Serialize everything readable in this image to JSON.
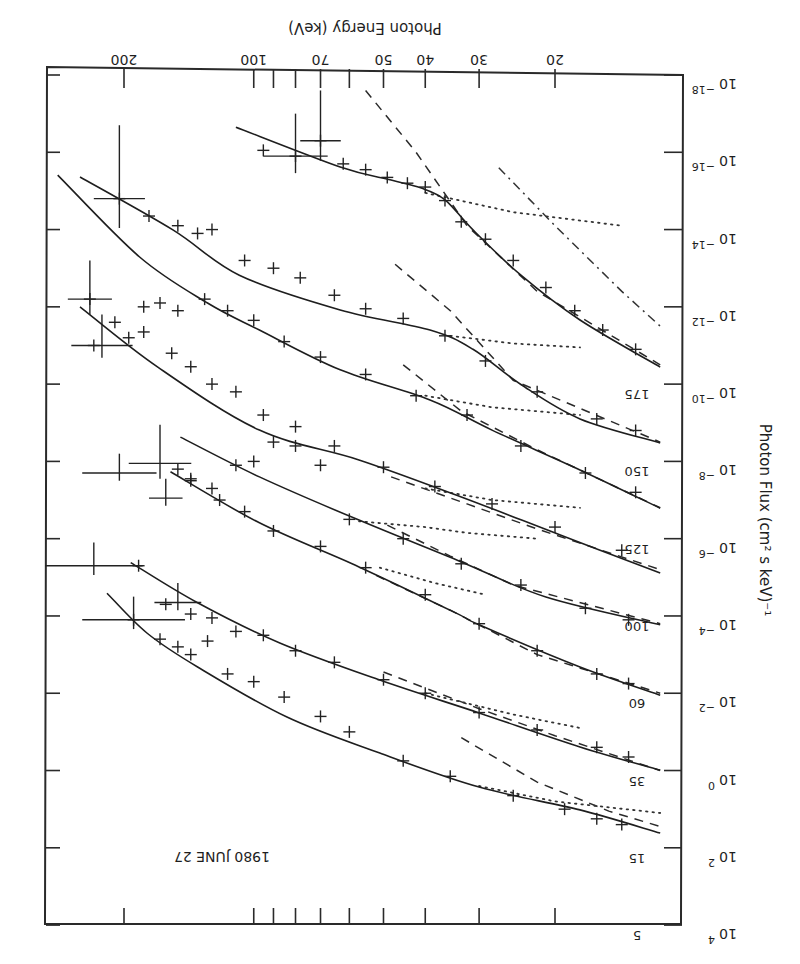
{
  "chart_data": {
    "type": "line",
    "title": "1980 JUNE 27",
    "xlabel": "Photon Energy (keV)",
    "ylabel": "Photon Flux (cm² s keV)⁻¹",
    "xscale": "log",
    "yscale": "log",
    "orientation_note": "figure displayed rotated 180 degrees",
    "xlim": [
      11,
      300
    ],
    "ylim_exponent": [
      -18,
      4
    ],
    "x_ticks": [
      {
        "value": 20,
        "label": "20"
      },
      {
        "value": 30,
        "label": "30"
      },
      {
        "value": 40,
        "label": "40"
      },
      {
        "value": 50,
        "label": "50"
      },
      {
        "value": 60,
        "label": ""
      },
      {
        "value": 70,
        "label": "70"
      },
      {
        "value": 80,
        "label": ""
      },
      {
        "value": 90,
        "label": ""
      },
      {
        "value": 100,
        "label": "100"
      },
      {
        "value": 200,
        "label": "200"
      }
    ],
    "y_ticks": [
      {
        "exp": -18,
        "base": "10",
        "sup": "−18"
      },
      {
        "exp": -16,
        "base": "10",
        "sup": "−16"
      },
      {
        "exp": -14,
        "base": "10",
        "sup": "−14"
      },
      {
        "exp": -12,
        "base": "10",
        "sup": "−12"
      },
      {
        "exp": -10,
        "base": "10",
        "sup": "−10"
      },
      {
        "exp": -8,
        "base": "10",
        "sup": "−8"
      },
      {
        "exp": -6,
        "base": "10",
        "sup": "−6"
      },
      {
        "exp": -4,
        "base": "10",
        "sup": "−4"
      },
      {
        "exp": -2,
        "base": "10",
        "sup": "−2"
      },
      {
        "exp": 0,
        "base": "10",
        "sup": "0"
      },
      {
        "exp": 2,
        "base": "10",
        "sup": "2"
      },
      {
        "exp": 4,
        "base": "10",
        "sup": "4"
      }
    ],
    "series": [
      {
        "name": "5",
        "label_exp": 4.0,
        "fit": [
          [
            219,
            -4.59
          ],
          [
            177,
            -3.56
          ],
          [
            135,
            -2.68
          ],
          [
            84,
            -1.39
          ],
          [
            51,
            -0.45
          ],
          [
            30,
            0.43
          ],
          [
            17.5,
            1.02
          ],
          [
            11.4,
            1.62
          ]
        ],
        "dotted": [
          [
            30,
            0.4
          ],
          [
            20,
            0.8
          ],
          [
            11.4,
            1.1
          ]
        ],
        "dashed": [
          [
            33,
            -0.85
          ],
          [
            22,
            0.3
          ],
          [
            15,
            1.05
          ],
          [
            11.4,
            1.45
          ]
        ],
        "points": [
          [
            190,
            -3.9
          ],
          [
            165,
            -3.4
          ],
          [
            150,
            -3.2
          ],
          [
            140,
            -3.0
          ],
          [
            128,
            -3.35
          ],
          [
            115,
            -2.5
          ],
          [
            100,
            -2.3
          ],
          [
            85,
            -1.9
          ],
          [
            70,
            -1.4
          ],
          [
            60,
            -1.0
          ],
          [
            45,
            -0.25
          ],
          [
            35,
            0.15
          ],
          [
            25,
            0.65
          ],
          [
            19,
            1.0
          ],
          [
            16,
            1.25
          ],
          [
            14,
            1.4
          ]
        ],
        "bigerr": [
          [
            190,
            -3.9,
            60,
            0.6
          ]
        ]
      },
      {
        "name": "15",
        "label_exp": 2.0,
        "fit": [
          [
            193,
            -5.38
          ],
          [
            135,
            -4.34
          ],
          [
            87,
            -3.3
          ],
          [
            51,
            -2.34
          ],
          [
            30,
            -1.49
          ],
          [
            17.5,
            -0.61
          ],
          [
            11.4,
            -0.01
          ]
        ],
        "dotted": [
          [
            40,
            -2.0
          ],
          [
            25,
            -1.45
          ],
          [
            17.5,
            -1.1
          ]
        ],
        "dashed": [
          [
            50,
            -2.55
          ],
          [
            30,
            -1.6
          ],
          [
            20,
            -0.9
          ],
          [
            11.4,
            0.0
          ]
        ],
        "points": [
          [
            185,
            -5.3
          ],
          [
            160,
            -4.3
          ],
          [
            140,
            -4.05
          ],
          [
            125,
            -3.95
          ],
          [
            110,
            -3.6
          ],
          [
            95,
            -3.5
          ],
          [
            80,
            -3.1
          ],
          [
            65,
            -2.8
          ],
          [
            50,
            -2.35
          ],
          [
            40,
            -2.0
          ],
          [
            30,
            -1.5
          ],
          [
            22,
            -1.05
          ],
          [
            16,
            -0.6
          ],
          [
            13.5,
            -0.35
          ]
        ],
        "bigerr": [
          [
            235,
            -5.3,
            70,
            0.6
          ],
          [
            150,
            -4.35,
            20,
            0.5
          ]
        ]
      },
      {
        "name": "35",
        "label_exp": 0.0,
        "fit": [
          [
            156,
            -7.73
          ],
          [
            97,
            -6.41
          ],
          [
            57,
            -5.27
          ],
          [
            34,
            -4.08
          ],
          [
            30,
            -3.77
          ],
          [
            17.5,
            -2.68
          ],
          [
            11.4,
            -1.95
          ]
        ],
        "dotted": [
          [
            51,
            -5.25
          ],
          [
            38,
            -4.85
          ],
          [
            29,
            -4.55
          ]
        ],
        "dashed": [
          [
            52,
            -5.05
          ],
          [
            35,
            -4.15
          ],
          [
            22,
            -3.0
          ],
          [
            11.4,
            -2.0
          ]
        ],
        "points": [
          [
            140,
            -7.55
          ],
          [
            120,
            -7.0
          ],
          [
            105,
            -6.7
          ],
          [
            90,
            -6.2
          ],
          [
            70,
            -5.8
          ],
          [
            55,
            -5.25
          ],
          [
            40,
            -4.55
          ],
          [
            30,
            -3.8
          ],
          [
            22,
            -3.1
          ],
          [
            16,
            -2.5
          ],
          [
            13.5,
            -2.25
          ]
        ],
        "bigerr": [
          [
            205,
            -7.7,
            45,
            0.5
          ],
          [
            160,
            -7.05,
            15,
            0.5
          ]
        ]
      },
      {
        "name": "60",
        "label_exp": -2.0,
        "fit": [
          [
            148,
            -8.63
          ],
          [
            97,
            -7.6
          ],
          [
            57,
            -6.48
          ],
          [
            33,
            -5.4
          ],
          [
            21,
            -4.49
          ],
          [
            11.4,
            -3.77
          ]
        ],
        "dotted": [
          [
            57,
            -6.45
          ],
          [
            40,
            -6.3
          ],
          [
            32,
            -6.15
          ],
          [
            22,
            -6.0
          ]
        ],
        "dashed": [
          [
            49,
            -6.35
          ],
          [
            35,
            -5.55
          ],
          [
            25,
            -4.8
          ],
          [
            11.4,
            -3.8
          ]
        ],
        "points": [
          [
            150,
            -7.8
          ],
          [
            140,
            -7.5
          ],
          [
            125,
            -7.3
          ],
          [
            110,
            -7.9
          ],
          [
            100,
            -8.0
          ],
          [
            90,
            -8.5
          ],
          [
            80,
            -8.4
          ],
          [
            70,
            -7.9
          ],
          [
            60,
            -6.5
          ],
          [
            45,
            -6.0
          ],
          [
            33,
            -5.35
          ],
          [
            24,
            -4.8
          ],
          [
            17,
            -4.2
          ],
          [
            13.5,
            -3.9
          ]
        ],
        "bigerr": [
          [
            165,
            -7.95,
            30,
            1.0
          ]
        ]
      },
      {
        "name": "100",
        "label_exp": -4.0,
        "fit": [
          [
            253,
            -12.0
          ],
          [
            167,
            -10.44
          ],
          [
            97,
            -8.81
          ],
          [
            57,
            -8.04
          ],
          [
            33,
            -7.08
          ],
          [
            19.5,
            -6.1
          ],
          [
            11.4,
            -5.11
          ]
        ],
        "dotted": [
          [
            40,
            -7.3
          ],
          [
            28,
            -7.0
          ],
          [
            17.5,
            -6.8
          ]
        ],
        "dashed": [
          [
            48,
            -7.6
          ],
          [
            32,
            -6.9
          ],
          [
            22,
            -6.25
          ],
          [
            11.4,
            -5.2
          ]
        ],
        "points": [
          [
            235,
            -11.0
          ],
          [
            195,
            -11.2
          ],
          [
            180,
            -11.35
          ],
          [
            155,
            -10.8
          ],
          [
            140,
            -10.45
          ],
          [
            125,
            -10.0
          ],
          [
            110,
            -9.8
          ],
          [
            95,
            -9.2
          ],
          [
            80,
            -8.9
          ],
          [
            65,
            -8.4
          ],
          [
            50,
            -7.85
          ],
          [
            38,
            -7.35
          ],
          [
            28,
            -6.9
          ],
          [
            20,
            -6.3
          ],
          [
            14,
            -5.7
          ]
        ],
        "bigerr": [
          [
            225,
            -11.0,
            40,
            0.8
          ]
        ]
      },
      {
        "name": "125",
        "label_exp": -6.0,
        "fit": [
          [
            285,
            -15.41
          ],
          [
            184,
            -13.29
          ],
          [
            128,
            -12.1
          ],
          [
            97,
            -11.4
          ],
          [
            63,
            -10.37
          ],
          [
            39,
            -9.59
          ],
          [
            28,
            -8.81
          ],
          [
            17.5,
            -7.78
          ],
          [
            11.4,
            -6.79
          ]
        ],
        "dotted": [
          [
            40,
            -9.7
          ],
          [
            28,
            -9.4
          ],
          [
            17.5,
            -9.2
          ]
        ],
        "dashed": [
          [
            45,
            -10.5
          ],
          [
            33,
            -9.3
          ],
          [
            22,
            -8.3
          ],
          [
            11.4,
            -6.8
          ]
        ],
        "points": [
          [
            240,
            -12.2
          ],
          [
            210,
            -11.6
          ],
          [
            180,
            -12.0
          ],
          [
            165,
            -12.1
          ],
          [
            150,
            -11.9
          ],
          [
            130,
            -12.2
          ],
          [
            115,
            -11.9
          ],
          [
            100,
            -11.65
          ],
          [
            85,
            -11.1
          ],
          [
            70,
            -10.7
          ],
          [
            55,
            -10.25
          ],
          [
            42,
            -9.7
          ],
          [
            32,
            -9.2
          ],
          [
            24,
            -8.4
          ],
          [
            17,
            -7.7
          ],
          [
            13,
            -7.2
          ]
        ],
        "bigerr": [
          [
            240,
            -12.2,
            30,
            1.0
          ]
        ]
      },
      {
        "name": "150",
        "label_exp": -8.0,
        "fit": [
          [
            253,
            -15.36
          ],
          [
            154,
            -13.99
          ],
          [
            108,
            -12.82
          ],
          [
            63,
            -11.92
          ],
          [
            39,
            -11.4
          ],
          [
            31,
            -10.9
          ],
          [
            24,
            -9.99
          ],
          [
            17.5,
            -9.1
          ],
          [
            11.4,
            -8.48
          ]
        ],
        "dotted": [
          [
            35,
            -11.25
          ],
          [
            25,
            -11.05
          ],
          [
            17.5,
            -10.95
          ]
        ],
        "dashed": [
          [
            47,
            -13.1
          ],
          [
            35,
            -11.9
          ],
          [
            25,
            -10.1
          ],
          [
            11.4,
            -8.5
          ]
        ],
        "points": [
          [
            205,
            -14.8
          ],
          [
            175,
            -14.35
          ],
          [
            150,
            -14.1
          ],
          [
            135,
            -13.9
          ],
          [
            125,
            -14.0
          ],
          [
            105,
            -13.2
          ],
          [
            90,
            -13.0
          ],
          [
            78,
            -12.75
          ],
          [
            65,
            -12.3
          ],
          [
            55,
            -11.95
          ],
          [
            45,
            -11.7
          ],
          [
            36,
            -11.25
          ],
          [
            29,
            -10.6
          ],
          [
            22,
            -9.8
          ],
          [
            16,
            -9.1
          ],
          [
            13,
            -8.8
          ]
        ],
        "bigerr": [
          [
            205,
            -14.8,
            30,
            1.9
          ]
        ]
      },
      {
        "name": "175",
        "label_exp": -10.0,
        "fit": [
          [
            110,
            -16.65
          ],
          [
            63,
            -15.62
          ],
          [
            48,
            -15.28
          ],
          [
            41,
            -15.08
          ],
          [
            36,
            -14.77
          ],
          [
            31,
            -13.99
          ],
          [
            24,
            -12.82
          ],
          [
            17.5,
            -11.66
          ],
          [
            11.4,
            -10.44
          ]
        ],
        "dotted": [
          [
            40,
            -14.95
          ],
          [
            25,
            -14.45
          ],
          [
            14,
            -14.1
          ]
        ],
        "dashed": [
          [
            55,
            -17.6
          ],
          [
            42,
            -16.0
          ],
          [
            32,
            -14.1
          ],
          [
            22,
            -12.4
          ],
          [
            11.4,
            -10.5
          ]
        ],
        "dashdot": [
          [
            27,
            -15.6
          ],
          [
            20,
            -14.1
          ],
          [
            14,
            -12.4
          ],
          [
            11.4,
            -11.5
          ]
        ],
        "points": [
          [
            95,
            -16.05
          ],
          [
            80,
            -15.9
          ],
          [
            70,
            -16.3
          ],
          [
            62,
            -15.7
          ],
          [
            55,
            -15.55
          ],
          [
            49,
            -15.35
          ],
          [
            44,
            -15.2
          ],
          [
            40,
            -15.1
          ],
          [
            36,
            -14.75
          ],
          [
            33,
            -14.2
          ],
          [
            29,
            -13.75
          ],
          [
            25,
            -13.2
          ],
          [
            21,
            -12.5
          ],
          [
            18,
            -11.9
          ],
          [
            15.5,
            -11.4
          ],
          [
            13,
            -10.9
          ]
        ],
        "bigerr": [
          [
            80,
            -15.9,
            15,
            1.1
          ],
          [
            70,
            -16.3,
            8,
            1.3
          ]
        ]
      }
    ]
  }
}
